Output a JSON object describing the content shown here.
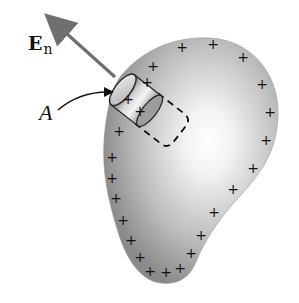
{
  "figure": {
    "labels": {
      "field": "E",
      "field_subscript": "n",
      "area": "A"
    },
    "charge_symbol": "+",
    "charges": [
      [
        182,
        47
      ],
      [
        153,
        66
      ],
      [
        213,
        44
      ],
      [
        243,
        57
      ],
      [
        262,
        84
      ],
      [
        270,
        112
      ],
      [
        266,
        140
      ],
      [
        253,
        168
      ],
      [
        233,
        189
      ],
      [
        214,
        212
      ],
      [
        201,
        235
      ],
      [
        191,
        253
      ],
      [
        180,
        268
      ],
      [
        166,
        272
      ],
      [
        150,
        271
      ],
      [
        140,
        257
      ],
      [
        131,
        240
      ],
      [
        123,
        220
      ],
      [
        116,
        198
      ],
      [
        112,
        178
      ],
      [
        112,
        157
      ],
      [
        119,
        131
      ],
      [
        140,
        111
      ],
      [
        128,
        99
      ],
      [
        147,
        82
      ]
    ],
    "colors": {
      "body_edge": "#7a7a7a",
      "body_highlight": "#ffffff",
      "charge": "#111111",
      "arrow": "#6f6f6f"
    }
  }
}
